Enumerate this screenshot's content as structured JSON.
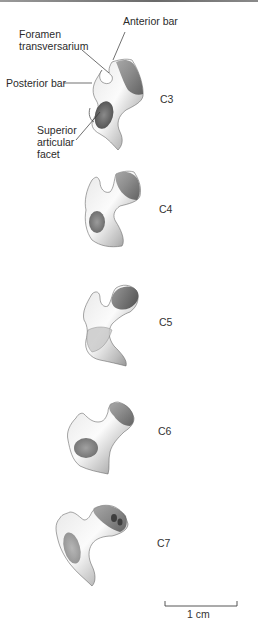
{
  "figure": {
    "annotations": {
      "foramen_line1": "Foramen",
      "foramen_line2": "transversarium",
      "anterior_bar": "Anterior bar",
      "posterior_bar": "Posterior bar",
      "superior_line1": "Superior",
      "superior_line2": "articular",
      "superior_line3": "facet"
    },
    "vertebrae": [
      {
        "label": "C3"
      },
      {
        "label": "C4"
      },
      {
        "label": "C5"
      },
      {
        "label": "C6"
      },
      {
        "label": "C7"
      }
    ],
    "scale_bar": {
      "label": "1 cm"
    },
    "colors": {
      "bone_light": "#f2f2f2",
      "bone_mid": "#a8a8a8",
      "bone_dark": "#5a5a5a",
      "line": "#333333"
    }
  }
}
